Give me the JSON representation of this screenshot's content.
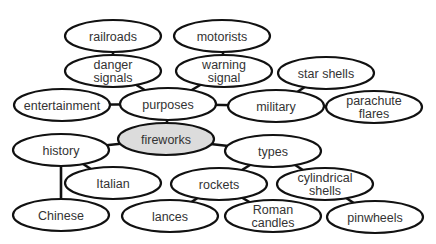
{
  "diagram": {
    "type": "concept-map",
    "colors": {
      "root_fill": "#dcdcdc",
      "node_fill": "#ffffff",
      "stroke": "#111111",
      "text": "#333333"
    },
    "nodes": [
      {
        "id": "railroads",
        "lines": [
          "railroads"
        ]
      },
      {
        "id": "motorists",
        "lines": [
          "motorists"
        ]
      },
      {
        "id": "danger",
        "lines": [
          "danger",
          "signals"
        ]
      },
      {
        "id": "warning",
        "lines": [
          "warning",
          "signal"
        ]
      },
      {
        "id": "starshells",
        "lines": [
          "star shells"
        ]
      },
      {
        "id": "entertainment",
        "lines": [
          "entertainment"
        ]
      },
      {
        "id": "purposes",
        "lines": [
          "purposes"
        ]
      },
      {
        "id": "military",
        "lines": [
          "military"
        ]
      },
      {
        "id": "parachute",
        "lines": [
          "parachute",
          "flares"
        ]
      },
      {
        "id": "fireworks",
        "lines": [
          "fireworks"
        ],
        "root": true
      },
      {
        "id": "history",
        "lines": [
          "history"
        ]
      },
      {
        "id": "types",
        "lines": [
          "types"
        ]
      },
      {
        "id": "italian",
        "lines": [
          "Italian"
        ]
      },
      {
        "id": "rockets",
        "lines": [
          "rockets"
        ]
      },
      {
        "id": "cylindrical",
        "lines": [
          "cylindrical",
          "shells"
        ]
      },
      {
        "id": "chinese",
        "lines": [
          "Chinese"
        ]
      },
      {
        "id": "lances",
        "lines": [
          "lances"
        ]
      },
      {
        "id": "roman",
        "lines": [
          "Roman",
          "candles"
        ]
      },
      {
        "id": "pinwheels",
        "lines": [
          "pinwheels"
        ]
      }
    ],
    "edges": [
      [
        "railroads",
        "danger"
      ],
      [
        "motorists",
        "warning"
      ],
      [
        "danger",
        "purposes"
      ],
      [
        "warning",
        "purposes"
      ],
      [
        "entertainment",
        "purposes"
      ],
      [
        "purposes",
        "military"
      ],
      [
        "military",
        "starshells"
      ],
      [
        "military",
        "parachute"
      ],
      [
        "purposes",
        "fireworks"
      ],
      [
        "fireworks",
        "history"
      ],
      [
        "fireworks",
        "types"
      ],
      [
        "history",
        "italian"
      ],
      [
        "history",
        "chinese"
      ],
      [
        "types",
        "rockets"
      ],
      [
        "types",
        "cylindrical"
      ],
      [
        "rockets",
        "lances"
      ],
      [
        "rockets",
        "roman"
      ],
      [
        "cylindrical",
        "pinwheels"
      ]
    ]
  }
}
